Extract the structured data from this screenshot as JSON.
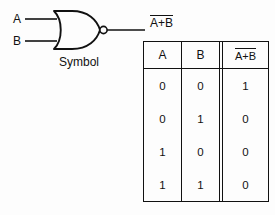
{
  "diagram": {
    "symbol": {
      "caption": "Symbol",
      "gate_type": "NOR",
      "inputs": [
        {
          "name": "input-a",
          "label": "A"
        },
        {
          "name": "input-b",
          "label": "B"
        }
      ],
      "output": {
        "name": "output",
        "expression": "A+B",
        "overbar": true,
        "display": "A+B"
      },
      "bubble": "inversion-bubble",
      "stroke_color": "#111111"
    },
    "table": {
      "headers": [
        {
          "label": "A",
          "overbar": false
        },
        {
          "label": "B",
          "overbar": false
        },
        {
          "label": "A+B",
          "overbar": true
        }
      ],
      "rows": [
        {
          "a": "0",
          "b": "0",
          "out": "1"
        },
        {
          "a": "0",
          "b": "1",
          "out": "0"
        },
        {
          "a": "1",
          "b": "0",
          "out": "0"
        },
        {
          "a": "1",
          "b": "1",
          "out": "0"
        }
      ]
    }
  }
}
